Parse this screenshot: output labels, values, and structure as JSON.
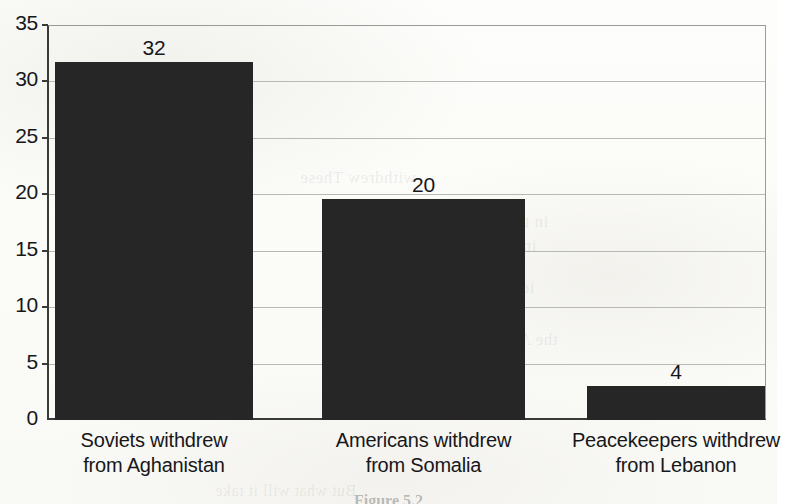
{
  "chart_data": {
    "type": "bar",
    "title": "",
    "subtitle": "",
    "xlabel": "",
    "ylabel": "",
    "categories": [
      "Soviets withdrew from Aghanistan",
      "Americans withdrew from Somalia",
      "Peacekeepers withdrew from Lebanon"
    ],
    "category_lines": [
      [
        "Soviets withdrew",
        "from Aghanistan"
      ],
      [
        "Americans withdrew",
        "from Somalia"
      ],
      [
        "Peacekeepers withdrew",
        "from Lebanon"
      ]
    ],
    "values": [
      32,
      20,
      4
    ],
    "bar_pixel_values": [
      31.7,
      19.6,
      3.0
    ],
    "data_labels": [
      "32",
      "20",
      "4"
    ],
    "ylim": [
      0,
      35
    ],
    "ytick_values": [
      0,
      5,
      10,
      15,
      20,
      25,
      30,
      35
    ],
    "ytick_labels": [
      "0",
      "5",
      "10",
      "15",
      "20",
      "25",
      "30",
      "35"
    ],
    "grid": true,
    "grid_axis": "y",
    "legend": false,
    "legend_position": "none",
    "bar_color": "#262626",
    "axis_color": "#3a3a38",
    "grid_color": "#b9b9b4",
    "text_color": "#17171a",
    "background_color": "#fdfdfb"
  },
  "caption": {
    "text": "Figure 5.2"
  },
  "bleed_through": [
    {
      "text": "withdrew These",
      "x": 300,
      "y": 168,
      "size": 17
    },
    {
      "text": "in the Unit",
      "x": 470,
      "y": 212,
      "size": 17
    },
    {
      "text": "ing all of",
      "x": 470,
      "y": 236,
      "size": 17
    },
    {
      "text": "ic events",
      "x": 470,
      "y": 278,
      "size": 17
    },
    {
      "text": "the Am",
      "x": 505,
      "y": 330,
      "size": 17
    },
    {
      "text": "But what will it take",
      "x": 215,
      "y": 482,
      "size": 16
    }
  ]
}
